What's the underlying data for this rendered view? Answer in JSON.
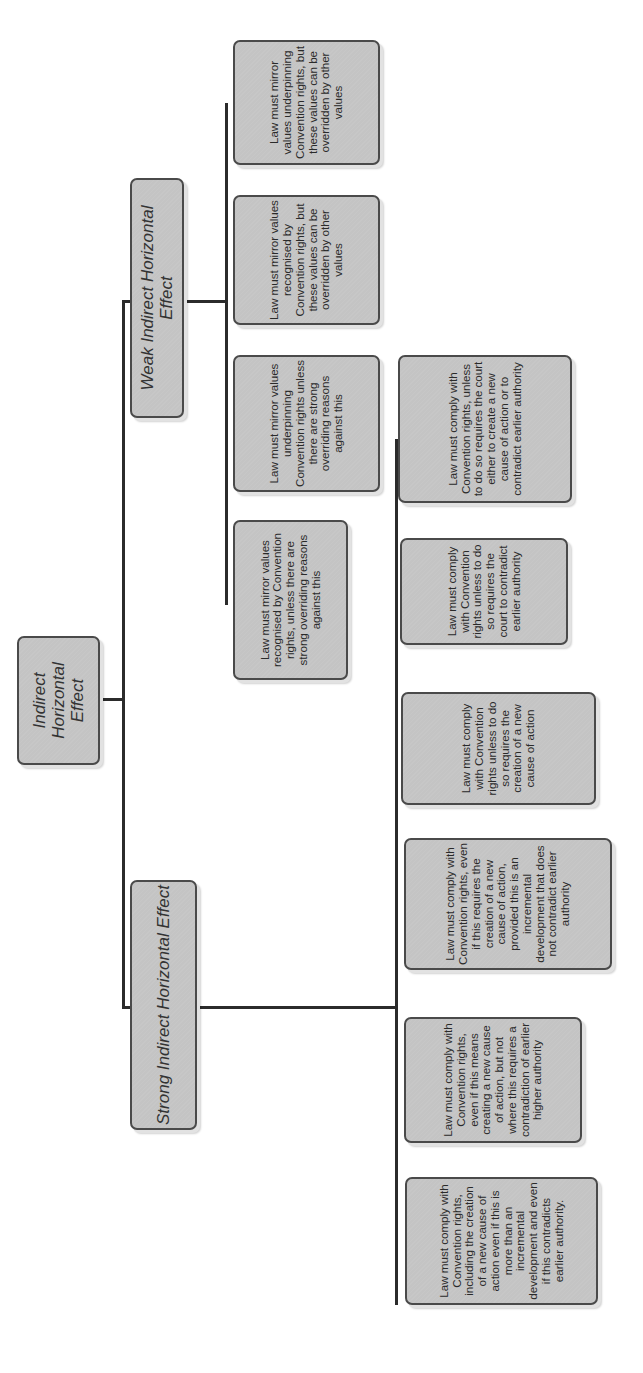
{
  "diagram": {
    "root": {
      "label": "Indirect Horizontal Effect"
    },
    "branches": [
      {
        "label": "Strong Indirect Horizontal Effect",
        "leaves": [
          "Law must comply with Convention rights, including the creation of a new cause of action even if this is more than an incremental development and even if this contradicts earlier authority.",
          "Law must comply with Convention rights, even if this means creating a new cause of action, but not where this requires a contradiction of earlier higher authority",
          "Law must comply with Convention rights, even if this requires the creation of a new cause of action, provided this is an incremental development that does not contradict earlier authority",
          "Law must comply with Convention rights unless to do so requires the creation of a new cause of action",
          "Law must comply with Convention rights unless to do so requires the court to contradict earlier authority",
          "Law must comply with Convention rights, unless to do so requires the court either to create a new cause of action or to contradict earlier authority"
        ]
      },
      {
        "label": "Weak Indirect Horizontal Effect",
        "leaves": [
          "Law must mirror values recognised by Convention rights, unless there are strong overriding reasons against this",
          "Law must mirror values underpinning Convention rights unless there are strong overriding reasons against this",
          "Law must mirror values recognised by Convention rights, but these values can be overridden by other values",
          "Law must mirror values underpinning Convention rights, but these values can be overridden by other values"
        ]
      }
    ],
    "colors": {
      "node_fill": "#c4c4c4",
      "node_border": "#4a4a4a",
      "connector": "#2b2b2b",
      "background": "#ffffff"
    }
  }
}
